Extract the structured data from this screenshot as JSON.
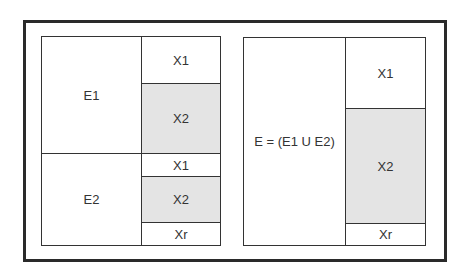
{
  "diagram": {
    "left_panel": {
      "events": [
        {
          "label": "E1"
        },
        {
          "label": "E2"
        }
      ],
      "subsets": [
        {
          "label": "X1",
          "shaded": false
        },
        {
          "label": "X2",
          "shaded": true
        },
        {
          "label": "X1",
          "shaded": false
        },
        {
          "label": "X2",
          "shaded": true
        },
        {
          "label": "Xr",
          "shaded": false
        }
      ]
    },
    "right_panel": {
      "event": {
        "label": "E = (E1 U E2)"
      },
      "subsets": [
        {
          "label": "X1",
          "shaded": false
        },
        {
          "label": "X2",
          "shaded": true
        },
        {
          "label": "Xr",
          "shaded": false
        }
      ]
    },
    "colors": {
      "border": "#333333",
      "shaded": "#e4e4e4",
      "background": "#ffffff"
    }
  }
}
